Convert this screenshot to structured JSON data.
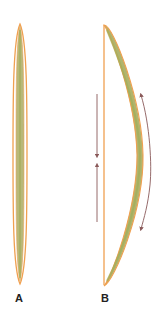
{
  "figure": {
    "panels": [
      {
        "id": "A",
        "label": "A",
        "description": "straight rod, outlined"
      },
      {
        "id": "B",
        "label": "B",
        "description": "bent/bowed rod with compression and tension arrows"
      }
    ],
    "colors": {
      "outline": "#f0a050",
      "fill": "#b9b878",
      "fill_core": "#a9b060",
      "arrow": "#8a5a5a"
    }
  }
}
